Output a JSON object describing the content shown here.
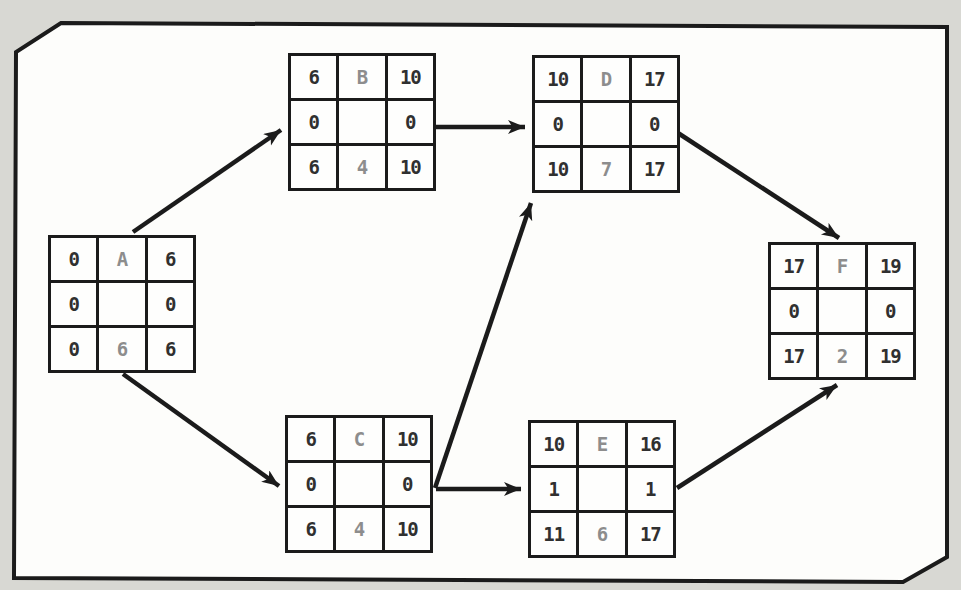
{
  "diagram": {
    "kind": "activity-node-network",
    "nodes": [
      {
        "id": "A",
        "cells": [
          "0",
          "A",
          "6",
          "0",
          "",
          "0",
          "0",
          "6",
          "6"
        ]
      },
      {
        "id": "B",
        "cells": [
          "6",
          "B",
          "10",
          "0",
          "",
          "0",
          "6",
          "4",
          "10"
        ]
      },
      {
        "id": "C",
        "cells": [
          "6",
          "C",
          "10",
          "0",
          "",
          "0",
          "6",
          "4",
          "10"
        ]
      },
      {
        "id": "D",
        "cells": [
          "10",
          "D",
          "17",
          "0",
          "",
          "0",
          "10",
          "7",
          "17"
        ]
      },
      {
        "id": "E",
        "cells": [
          "10",
          "E",
          "16",
          "1",
          "",
          "1",
          "11",
          "6",
          "17"
        ]
      },
      {
        "id": "F",
        "cells": [
          "17",
          "F",
          "19",
          "0",
          "",
          "0",
          "17",
          "2",
          "19"
        ]
      }
    ],
    "edges": [
      {
        "from": "A",
        "to": "B"
      },
      {
        "from": "A",
        "to": "C"
      },
      {
        "from": "B",
        "to": "D"
      },
      {
        "from": "C",
        "to": "D"
      },
      {
        "from": "C",
        "to": "E"
      },
      {
        "from": "D",
        "to": "F"
      },
      {
        "from": "E",
        "to": "F"
      }
    ],
    "colors": {
      "line": "#1b1b1b",
      "value_text": "#303030",
      "muted_text": "#8d8d8d",
      "page_bg": "#d8d8d3",
      "panel_bg": "#fdfdfb"
    }
  }
}
